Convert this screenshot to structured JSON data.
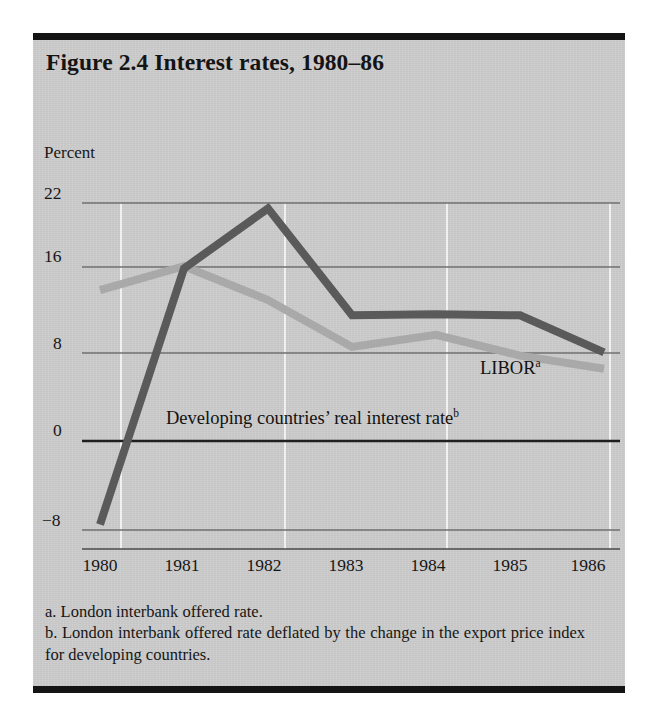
{
  "figure": {
    "title": "Figure 2.4 Interest rates, 1980–86",
    "axis_unit_label": "Percent",
    "series_label_libor": "LIBOR",
    "series_label_libor_marker": "a",
    "series_label_developing": "Developing countries’ real interest rate",
    "series_label_developing_marker": "b",
    "footnote_a": "a. London interbank offered rate.",
    "footnote_b": "b. London interbank offered rate deflated by the change in the export price index for developing countries."
  },
  "colors": {
    "paper": "#cdcdcd",
    "rule": "#141414",
    "text": "#161616",
    "gridline": "#6f6f6f",
    "zero_line": "#222222",
    "vertical_gridline": "#f2f2f2",
    "series_developing": "#5a5a5a",
    "series_libor": "#a9a9a9"
  },
  "chart_data": {
    "type": "line",
    "title": "Figure 2.4 Interest rates, 1980–86",
    "xlabel": "",
    "ylabel": "Percent",
    "x": [
      "1980",
      "1981",
      "1982",
      "1983",
      "1984",
      "1985",
      "1986"
    ],
    "ylim": [
      -8,
      22
    ],
    "yticks": [
      22,
      16,
      8,
      0,
      -8
    ],
    "ytick_labels": [
      "22",
      "16",
      "8",
      "0",
      "−8"
    ],
    "grid": true,
    "grid_orientation": "both",
    "legend": "inline-annotations",
    "series": [
      {
        "name": "Developing countries’ real interest rate",
        "color": "#5a5a5a",
        "values": [
          -7.5,
          16.0,
          21.5,
          11.7,
          11.8,
          11.7,
          8.3
        ]
      },
      {
        "name": "LIBOR",
        "color": "#a9a9a9",
        "values": [
          14.0,
          16.2,
          13.1,
          8.8,
          9.9,
          8.0,
          6.8
        ]
      }
    ],
    "annotations": [
      {
        "text": "LIBOR",
        "superscript": "a",
        "x": "1985",
        "y": 5.0
      },
      {
        "text": "Developing countries’ real interest rate",
        "superscript": "b",
        "x": "1982",
        "y": 1.1
      }
    ]
  }
}
